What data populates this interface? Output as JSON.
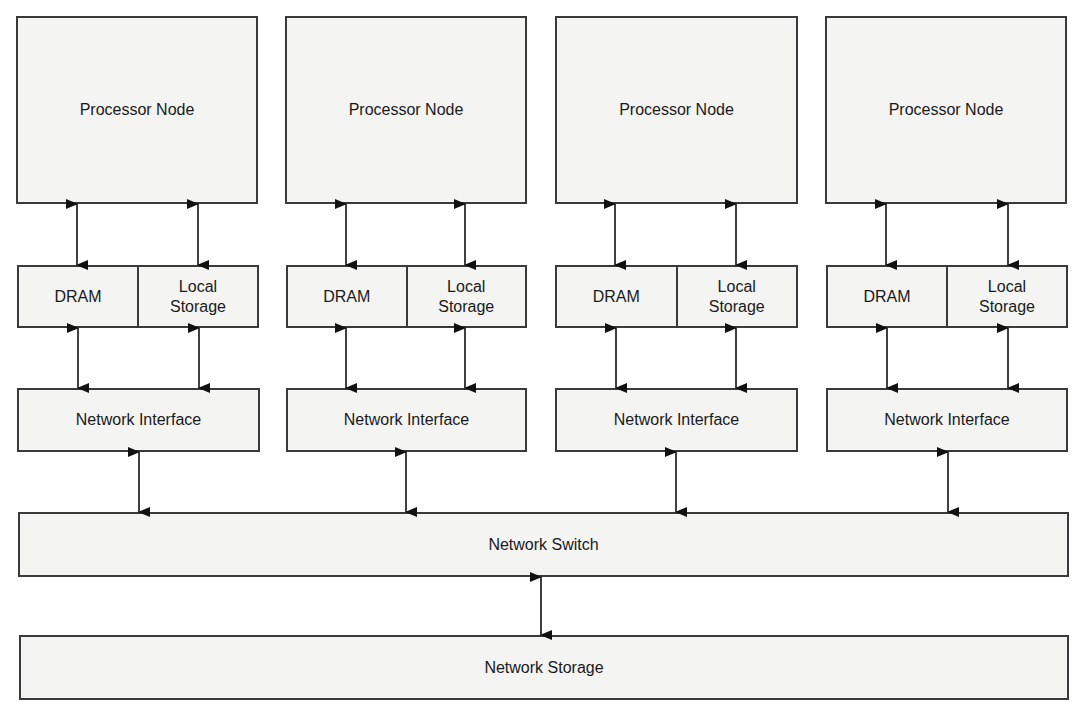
{
  "nodes": [
    {
      "processor": "Processor Node",
      "dram": "DRAM",
      "local_storage": "Local\nStorage",
      "network_interface": "Network Interface"
    },
    {
      "processor": "Processor Node",
      "dram": "DRAM",
      "local_storage": "Local\nStorage",
      "network_interface": "Network Interface"
    },
    {
      "processor": "Processor Node",
      "dram": "DRAM",
      "local_storage": "Local\nStorage",
      "network_interface": "Network Interface"
    },
    {
      "processor": "Processor Node",
      "dram": "DRAM",
      "local_storage": "Local\nStorage",
      "network_interface": "Network Interface"
    }
  ],
  "network_switch": "Network Switch",
  "network_storage": "Network Storage",
  "colors": {
    "box_fill": "#f4f4f3",
    "border": "#3a3a3a",
    "arrow": "#111111"
  }
}
